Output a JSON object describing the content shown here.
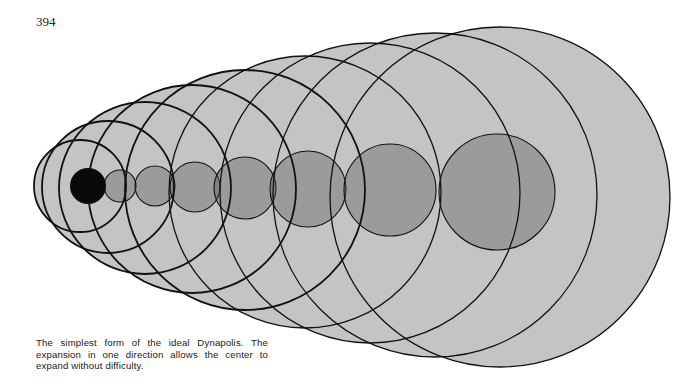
{
  "page": {
    "page_number": "394"
  },
  "figure": {
    "name": "ideal-dynapolis-diagram",
    "colors": {
      "background": "#ffffff",
      "outer_fill": "#c4c4c4",
      "band_fill": "#5a5a5a",
      "core_fill": "#0a0a0a",
      "inner_circle_fill": "#4f4f4f",
      "line": "#111111"
    },
    "outer_circles": [
      {
        "cx": 80,
        "cy": 186,
        "r": 46
      },
      {
        "cx": 108,
        "cy": 187,
        "r": 66
      },
      {
        "cx": 145,
        "cy": 188,
        "r": 86
      },
      {
        "cx": 192,
        "cy": 189,
        "r": 104
      },
      {
        "cx": 245,
        "cy": 190,
        "r": 120
      },
      {
        "cx": 305,
        "cy": 192,
        "r": 136
      },
      {
        "cx": 370,
        "cy": 193,
        "r": 150
      },
      {
        "cx": 435,
        "cy": 195,
        "r": 162
      },
      {
        "cx": 500,
        "cy": 197,
        "r": 170
      }
    ],
    "inner_circles": [
      {
        "cx": 120,
        "cy": 186,
        "r": 16
      },
      {
        "cx": 155,
        "cy": 186,
        "r": 20
      },
      {
        "cx": 195,
        "cy": 187,
        "r": 25
      },
      {
        "cx": 245,
        "cy": 188,
        "r": 31
      },
      {
        "cx": 308,
        "cy": 189,
        "r": 38
      },
      {
        "cx": 390,
        "cy": 190,
        "r": 46
      },
      {
        "cx": 497,
        "cy": 192,
        "r": 58
      }
    ],
    "core": {
      "cx": 88,
      "cy": 186,
      "r": 18
    },
    "band": {
      "points": "88,168 650,117 660,288 88,205"
    }
  },
  "caption": {
    "text": "The simplest form of the ideal Dynapolis. The expansion in one direction allows the center to expand without difficulty."
  }
}
